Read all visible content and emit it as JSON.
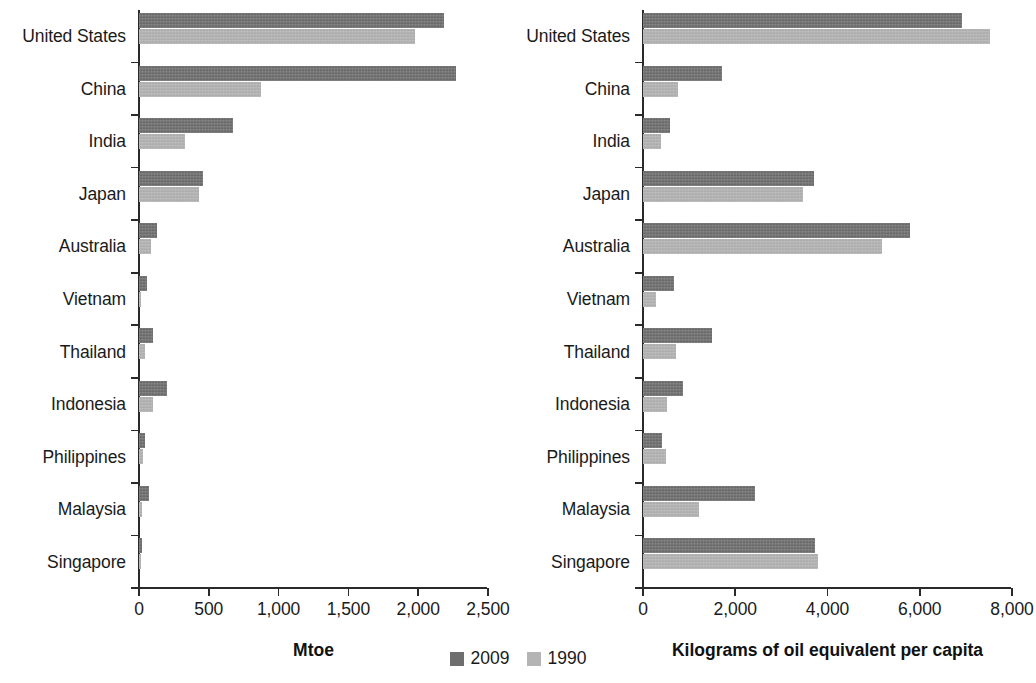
{
  "chart_data": [
    {
      "panel": "left",
      "type": "bar",
      "orientation": "horizontal",
      "title": "",
      "xlabel": "Mtoe",
      "ylabel": "",
      "xlim": [
        0,
        2500
      ],
      "xticks": [
        0,
        500,
        1000,
        1500,
        2000,
        2500
      ],
      "xticklabels": [
        "0",
        "500",
        "1,000",
        "1,500",
        "2,000",
        "2,500"
      ],
      "grid": false,
      "categories": [
        "United States",
        "China",
        "India",
        "Japan",
        "Australia",
        "Vietnam",
        "Thailand",
        "Indonesia",
        "Philippines",
        "Malaysia",
        "Singapore"
      ],
      "series": [
        {
          "name": "2009",
          "color": "#6e6e6e",
          "values": [
            2184,
            2270,
            673,
            458,
            128,
            59,
            97,
            203,
            40,
            72,
            22
          ]
        },
        {
          "name": "1990",
          "color": "#b4b4b4",
          "values": [
            1977,
            872,
            330,
            430,
            87,
            17,
            44,
            100,
            26,
            22,
            11
          ]
        }
      ]
    },
    {
      "panel": "right",
      "type": "bar",
      "orientation": "horizontal",
      "title": "",
      "xlabel": "Kilograms of oil equivalent per capita",
      "ylabel": "",
      "xlim": [
        0,
        8000
      ],
      "xticks": [
        0,
        2000,
        4000,
        6000,
        8000
      ],
      "xticklabels": [
        "0",
        "2,000",
        "4,000",
        "6,000",
        "8,000"
      ],
      "grid": false,
      "categories": [
        "United States",
        "China",
        "India",
        "Japan",
        "Australia",
        "Vietnam",
        "Thailand",
        "Indonesia",
        "Philippines",
        "Malaysia",
        "Singapore"
      ],
      "series": [
        {
          "name": "2009",
          "color": "#6e6e6e",
          "values": [
            6920,
            1715,
            585,
            3710,
            5790,
            680,
            1490,
            870,
            420,
            2420,
            3720
          ]
        },
        {
          "name": "1990",
          "color": "#b4b4b4",
          "values": [
            7530,
            760,
            390,
            3470,
            5180,
            290,
            720,
            530,
            490,
            1210,
            3790
          ]
        }
      ]
    }
  ],
  "legend": {
    "position": "bottom-center",
    "items": [
      {
        "label": "2009",
        "color": "#6e6e6e"
      },
      {
        "label": "1990",
        "color": "#b4b4b4"
      }
    ]
  }
}
